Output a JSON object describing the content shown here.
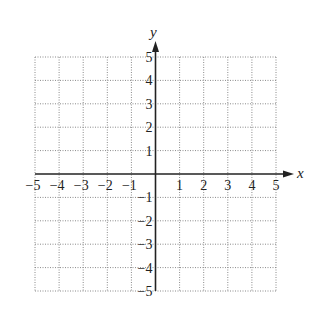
{
  "chart_data": {
    "type": "scatter",
    "title": "",
    "xlabel": "x",
    "ylabel": "y",
    "xlim": [
      -5,
      5
    ],
    "ylim": [
      -5,
      5
    ],
    "grid": true,
    "grid_style": "dotted",
    "x_ticks": [
      -5,
      -4,
      -3,
      -2,
      -1,
      1,
      2,
      3,
      4,
      5
    ],
    "y_ticks": [
      -5,
      -4,
      -3,
      -2,
      -1,
      1,
      2,
      3,
      4,
      5
    ],
    "x_tick_labels": [
      "−5",
      "−4",
      "−3",
      "−2",
      "−1",
      "1",
      "2",
      "3",
      "4",
      "5"
    ],
    "y_tick_labels": [
      "−5",
      "−4",
      "−3",
      "−2",
      "−1",
      "1",
      "2",
      "3",
      "4",
      "5"
    ],
    "series": [],
    "legend": null
  },
  "colors": {
    "axis": "#222222",
    "grid": "#8a8a8a",
    "background": "#ffffff"
  }
}
